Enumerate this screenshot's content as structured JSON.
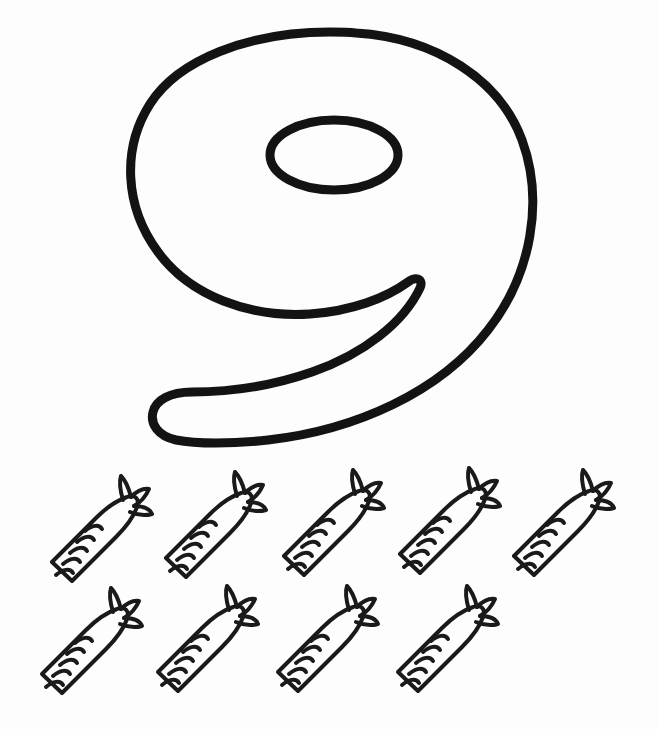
{
  "worksheet": {
    "kind": "counting-coloring-page",
    "numeral": "9",
    "numeral_word": "nine",
    "object_name": "carrot",
    "object_count": 9,
    "background_color": "#fdfdfd",
    "outline_color": "#1a1a1a"
  },
  "numeral": {
    "label": "9",
    "outline_color": "#131313",
    "stroke_width": 9,
    "fill": "none",
    "bounds": {
      "x": 128,
      "y": 28,
      "width": 412,
      "height": 420
    }
  },
  "objects": {
    "name": "carrot-outline",
    "total": 9,
    "stroke_color": "#1a1a1a",
    "stroke_width": 4,
    "fill": "none",
    "rows": [
      {
        "row_label": "top-row",
        "count": 5,
        "items": [
          {
            "index": 1,
            "label": "carrot-1",
            "x": 44,
            "y": 8,
            "scale": 1.0
          },
          {
            "index": 2,
            "label": "carrot-2",
            "x": 158,
            "y": 4,
            "scale": 1.0
          },
          {
            "index": 3,
            "label": "carrot-3",
            "x": 276,
            "y": 2,
            "scale": 1.0
          },
          {
            "index": 4,
            "label": "carrot-4",
            "x": 392,
            "y": 0,
            "scale": 1.0
          },
          {
            "index": 5,
            "label": "carrot-5",
            "x": 506,
            "y": 2,
            "scale": 1.0
          }
        ]
      },
      {
        "row_label": "bottom-row",
        "count": 4,
        "items": [
          {
            "index": 6,
            "label": "carrot-6",
            "x": 34,
            "y": 120,
            "scale": 1.0
          },
          {
            "index": 7,
            "label": "carrot-7",
            "x": 150,
            "y": 118,
            "scale": 1.0
          },
          {
            "index": 8,
            "label": "carrot-8",
            "x": 270,
            "y": 118,
            "scale": 1.0
          },
          {
            "index": 9,
            "label": "carrot-9",
            "x": 390,
            "y": 118,
            "scale": 1.0
          }
        ]
      }
    ]
  }
}
